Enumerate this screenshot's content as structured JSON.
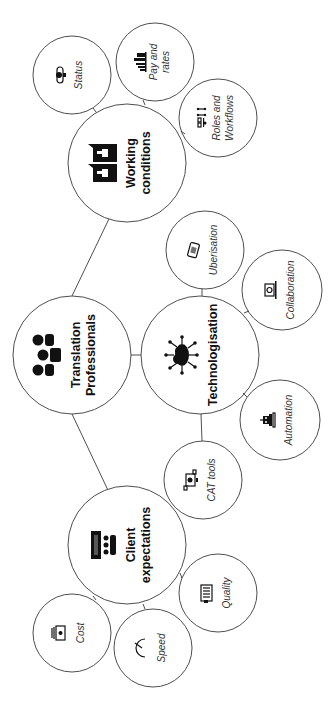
{
  "diagram": {
    "center": {
      "label_line1": "Translation",
      "label_line2": "Professionals",
      "icon": "people-group-icon"
    },
    "branches": [
      {
        "label_line1": "Working",
        "label_line2": "conditions",
        "icon": "thumbs-up-speech-bubbles-icon",
        "children": [
          {
            "label_line1": "Status",
            "label_line2": "",
            "icon": "status-icon"
          },
          {
            "label_line1": "Pay and",
            "label_line2": "rates",
            "icon": "bar-chart-icon"
          },
          {
            "label_line1": "Roles and",
            "label_line2": "Workflows",
            "icon": "workflow-icon"
          }
        ]
      },
      {
        "label_line1": "Technologisation",
        "label_line2": "",
        "icon": "cloud-network-icon",
        "children": [
          {
            "label_line1": "Uberisation",
            "label_line2": "",
            "icon": "smartphone-icon"
          },
          {
            "label_line1": "Collaboration",
            "label_line2": "",
            "icon": "laptop-globe-icon"
          },
          {
            "label_line1": "Automation",
            "label_line2": "",
            "icon": "robot-icon"
          },
          {
            "label_line1": "CAT tools",
            "label_line2": "",
            "icon": "computer-tools-icon"
          }
        ]
      },
      {
        "label_line1": "Client",
        "label_line2": "expectations",
        "icon": "audience-presentation-icon",
        "children": [
          {
            "label_line1": "Quality",
            "label_line2": "",
            "icon": "clipboard-icon"
          },
          {
            "label_line1": "Cost",
            "label_line2": "",
            "icon": "money-icon"
          },
          {
            "label_line1": "Speed",
            "label_line2": "",
            "icon": "speedometer-icon"
          }
        ]
      }
    ]
  }
}
